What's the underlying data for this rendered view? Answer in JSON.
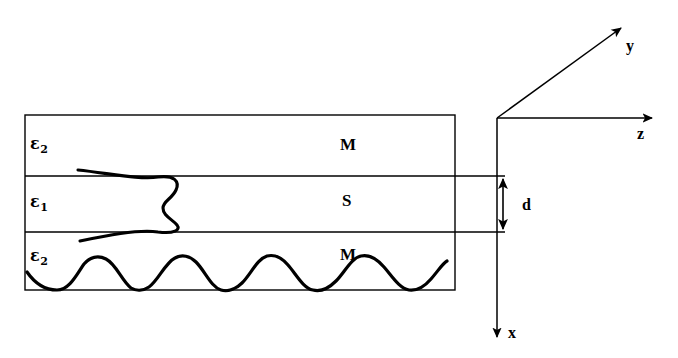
{
  "figure": {
    "type": "waveguide-cross-section-diagram",
    "background_color": "#ffffff",
    "line_color": "#000000",
    "width": 678,
    "height": 358
  },
  "layers": [
    {
      "id": "upper-metal",
      "permittivity_symbol": "ε",
      "permittivity_subscript": "2",
      "material_label": "M",
      "top": 115,
      "bottom": 176
    },
    {
      "id": "middle-semiconductor",
      "permittivity_symbol": "ε",
      "permittivity_subscript": "1",
      "material_label": "S",
      "top": 176,
      "bottom": 232
    },
    {
      "id": "lower-metal",
      "permittivity_symbol": "ε",
      "permittivity_subscript": "2",
      "material_label": "M",
      "top": 232,
      "bottom": 290
    }
  ],
  "dimension": {
    "label": "d",
    "from_y": 176,
    "to_y": 232
  },
  "axes": {
    "origin": {
      "x": 497,
      "y": 118
    },
    "items": [
      {
        "name": "y",
        "label": "y",
        "direction": "up-right-diagonal"
      },
      {
        "name": "z",
        "label": "z",
        "direction": "right"
      },
      {
        "name": "x",
        "label": "x",
        "direction": "down"
      }
    ]
  },
  "curves": [
    {
      "name": "guided-mode-field-profile",
      "description": "field amplitude profile across the three layers"
    },
    {
      "name": "corrugation-wave",
      "description": "sinusoidal wave in lower metal layer",
      "peaks": 4
    }
  ]
}
